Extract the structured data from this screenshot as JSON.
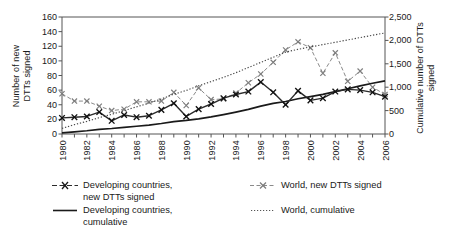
{
  "chart_data": {
    "type": "line",
    "title": "",
    "xlabel": "",
    "ylabel": "Number of new\nDTTs signed",
    "ylabel_right": "Cumulative number of DTTs\nsigned",
    "x": [
      1980,
      1981,
      1982,
      1983,
      1984,
      1985,
      1986,
      1987,
      1988,
      1989,
      1990,
      1991,
      1992,
      1993,
      1994,
      1995,
      1996,
      1997,
      1998,
      1999,
      2000,
      2001,
      2002,
      2003,
      2004,
      2005,
      2006
    ],
    "xtick_labels": [
      "1980",
      "1982",
      "1984",
      "1986",
      "1988",
      "1990",
      "1992",
      "1994",
      "1996",
      "1998",
      "2000",
      "2002",
      "2004",
      "2006"
    ],
    "xtick_step_years": 2,
    "xlim": [
      1980,
      2006
    ],
    "ylim": [
      0,
      160
    ],
    "ytick_labels": [
      "0",
      "20",
      "40",
      "60",
      "80",
      "100",
      "120",
      "140",
      "160"
    ],
    "ylim_right": [
      0,
      2500
    ],
    "ytick_labels_right": [
      "0",
      "500",
      "1,000",
      "1,500",
      "2,000",
      "2,500"
    ],
    "grid": false,
    "legend_position": "below",
    "series": [
      {
        "name": "Developing countries, new DTTs signed",
        "axis": "left",
        "style": "solid-marker",
        "color": "#2b2b2b",
        "values": [
          22,
          23,
          24,
          30,
          18,
          26,
          23,
          25,
          33,
          42,
          24,
          34,
          41,
          49,
          54,
          58,
          71,
          57,
          40,
          59,
          46,
          49,
          58,
          61,
          60,
          57,
          51
        ]
      },
      {
        "name": "World, new DTTs signed",
        "axis": "left",
        "style": "dashed-marker",
        "color": "#8a8a8a",
        "values": [
          55,
          45,
          45,
          38,
          32,
          34,
          44,
          44,
          45,
          57,
          39,
          63,
          47,
          48,
          56,
          70,
          82,
          98,
          115,
          126,
          118,
          83,
          111,
          72,
          86,
          64,
          54
        ]
      },
      {
        "name": "Developing countries, cumulative",
        "axis": "right",
        "style": "solid",
        "color": "#1a1a1a",
        "values": [
          22,
          45,
          69,
          99,
          117,
          143,
          166,
          191,
          224,
          266,
          290,
          324,
          365,
          414,
          468,
          526,
          597,
          654,
          694,
          753,
          799,
          848,
          906,
          967,
          1027,
          1084,
          1135
        ]
      },
      {
        "name": "World, cumulative",
        "axis": "right",
        "style": "dotted",
        "color": "#4a4a4a",
        "values": [
          120,
          200,
          270,
          350,
          420,
          500,
          580,
          660,
          750,
          850,
          930,
          1030,
          1120,
          1210,
          1310,
          1420,
          1530,
          1640,
          1750,
          1810,
          1860,
          1910,
          1960,
          2010,
          2060,
          2110,
          2160
        ]
      }
    ]
  },
  "legend": {
    "items": [
      {
        "key": "marker-solid",
        "label": "Developing countries,\nnew DTTs signed"
      },
      {
        "key": "line-solid",
        "label": "Developing countries,\ncumulative"
      },
      {
        "key": "marker-dashed",
        "label": "World, new DTTs signed"
      },
      {
        "key": "line-dotted",
        "label": "World, cumulative"
      }
    ]
  }
}
